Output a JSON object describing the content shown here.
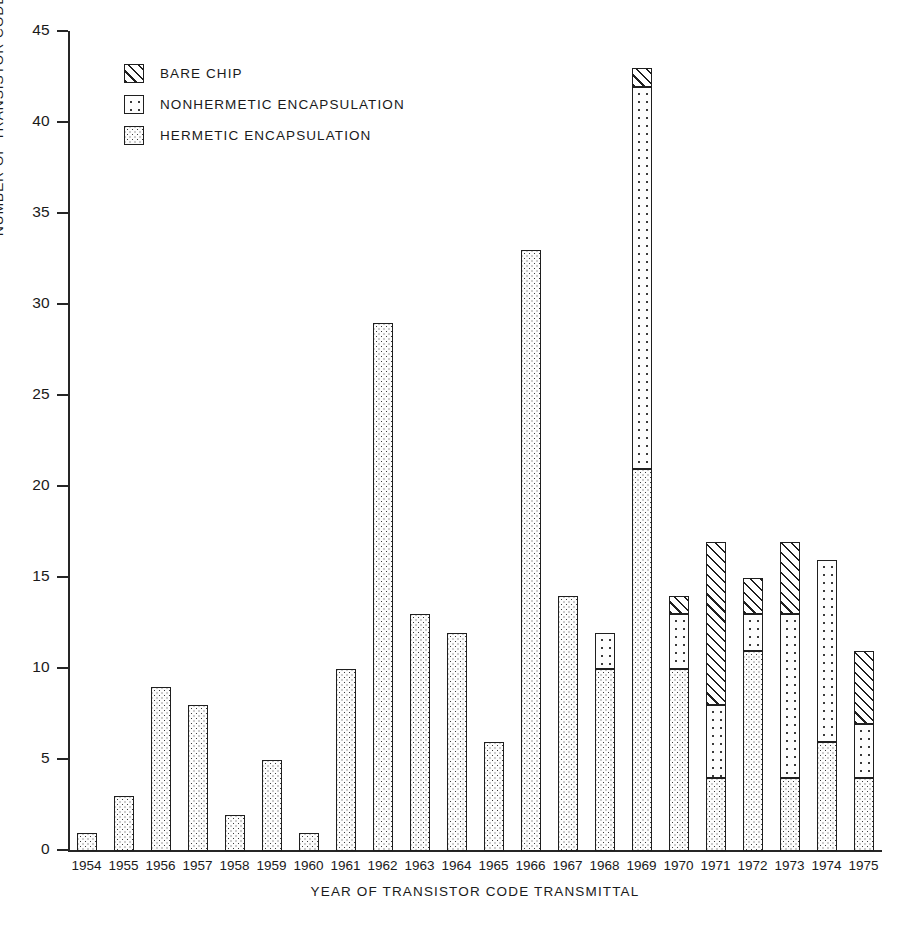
{
  "chart_data": {
    "type": "bar",
    "title": "",
    "subtitle": "",
    "xlabel": "YEAR OF TRANSISTOR CODE TRANSMITTAL",
    "ylabel": "NUMBER OF TRANSISTOR CODES",
    "ylim": [
      0,
      45
    ],
    "ytick_values": [
      0,
      5,
      10,
      15,
      20,
      25,
      30,
      35,
      40,
      45
    ],
    "ytick_labels": [
      "0",
      "5",
      "10",
      "15",
      "20",
      "25",
      "30",
      "35",
      "40",
      "45"
    ],
    "grid": false,
    "stacked": true,
    "legend_position": "top-left",
    "categories": [
      "1954",
      "1955",
      "1956",
      "1957",
      "1958",
      "1959",
      "1960",
      "1961",
      "1962",
      "1963",
      "1964",
      "1965",
      "1966",
      "1967",
      "1968",
      "1969",
      "1970",
      "1971",
      "1972",
      "1973",
      "1974",
      "1975"
    ],
    "series": [
      {
        "name": "HERMETIC ENCAPSULATION",
        "fill": "hermetic",
        "values": [
          1,
          3,
          9,
          8,
          2,
          5,
          1,
          10,
          29,
          13,
          12,
          6,
          33,
          14,
          10,
          21,
          10,
          4,
          11,
          4,
          6,
          4
        ]
      },
      {
        "name": "NONHERMETIC ENCAPSULATION",
        "fill": "nonhermetic",
        "values": [
          0,
          0,
          0,
          0,
          0,
          0,
          0,
          0,
          0,
          0,
          0,
          0,
          0,
          0,
          2,
          21,
          3,
          4,
          2,
          9,
          10,
          3
        ]
      },
      {
        "name": "BARE CHIP",
        "fill": "barechip",
        "values": [
          0,
          0,
          0,
          0,
          0,
          0,
          0,
          0,
          0,
          0,
          0,
          0,
          0,
          0,
          0,
          1,
          1,
          9,
          2,
          4,
          0,
          4
        ]
      }
    ],
    "totals": [
      1,
      3,
      9,
      8,
      2,
      5,
      1,
      10,
      29,
      13,
      12,
      6,
      33,
      14,
      12,
      43,
      14,
      17,
      15,
      17,
      16,
      11
    ]
  },
  "legend": {
    "items": [
      {
        "label": "BARE CHIP",
        "fill": "barechip"
      },
      {
        "label": "NONHERMETIC ENCAPSULATION",
        "fill": "nonhermetic"
      },
      {
        "label": "HERMETIC ENCAPSULATION",
        "fill": "hermetic"
      }
    ]
  },
  "colors": {
    "ink": "#1a1a1a",
    "axis": "#262626",
    "background": "#ffffff"
  }
}
